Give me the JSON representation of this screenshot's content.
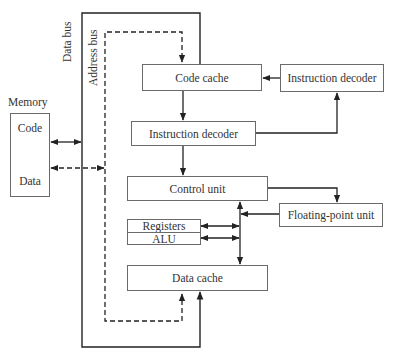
{
  "diagram": {
    "type": "block-diagram",
    "buses": {
      "data_bus": "Data bus",
      "address_bus": "Address bus"
    },
    "memory": {
      "title": "Memory",
      "sections": [
        "Code",
        "Data"
      ]
    },
    "blocks": {
      "code_cache": "Code cache",
      "instruction_decoder_right": "Instruction decoder",
      "instruction_decoder_main": "Instruction decoder",
      "control_unit": "Control unit",
      "floating_point_unit": "Floating-point unit",
      "registers": "Registers",
      "alu": "ALU",
      "data_cache": "Data cache"
    },
    "connections": [
      {
        "from": "memory.code",
        "to": "data_bus",
        "style": "solid",
        "direction": "bidirectional"
      },
      {
        "from": "memory.data",
        "to": "address_bus",
        "style": "dashed",
        "direction": "bidirectional"
      },
      {
        "from": "data_bus",
        "to": "code_cache",
        "style": "solid"
      },
      {
        "from": "address_bus",
        "to": "code_cache",
        "style": "dashed"
      },
      {
        "from": "instruction_decoder_right",
        "to": "code_cache",
        "style": "solid"
      },
      {
        "from": "code_cache",
        "to": "instruction_decoder_main",
        "style": "solid"
      },
      {
        "from": "instruction_decoder_main",
        "to": "instruction_decoder_right",
        "style": "solid"
      },
      {
        "from": "instruction_decoder_main",
        "to": "control_unit",
        "style": "solid"
      },
      {
        "from": "control_unit",
        "to": "floating_point_unit",
        "style": "solid"
      },
      {
        "from": "floating_point_unit",
        "to": "internal_bus",
        "style": "solid"
      },
      {
        "from": "internal_bus",
        "to": "control_unit",
        "style": "solid"
      },
      {
        "from": "internal_bus",
        "to": "registers",
        "style": "solid",
        "direction": "bidirectional"
      },
      {
        "from": "internal_bus",
        "to": "alu",
        "style": "solid",
        "direction": "bidirectional"
      },
      {
        "from": "internal_bus",
        "to": "data_cache",
        "style": "solid"
      },
      {
        "from": "address_bus",
        "to": "data_cache",
        "style": "dashed"
      },
      {
        "from": "data_bus",
        "to": "data_cache",
        "style": "solid"
      }
    ]
  }
}
